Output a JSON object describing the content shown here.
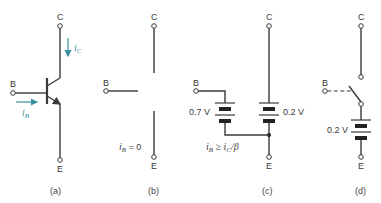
{
  "figure": {
    "panels": [
      {
        "id": "a",
        "caption": "(a)",
        "terminals": {
          "collector": "C",
          "base": "B",
          "emitter": "E"
        },
        "currents": {
          "collector": {
            "symbol": "i",
            "subscript": "C"
          },
          "base": {
            "symbol": "i",
            "subscript": "B"
          }
        }
      },
      {
        "id": "b",
        "caption": "(b)",
        "terminals": {
          "collector": "C",
          "base": "B",
          "emitter": "E"
        },
        "condition": {
          "symbol": "i",
          "subscript": "B",
          "relation": " = 0"
        }
      },
      {
        "id": "c",
        "caption": "(c)",
        "terminals": {
          "collector": "C",
          "base": "B",
          "emitter": "E"
        },
        "sources": [
          {
            "label": "0.7 V"
          },
          {
            "label": "0.2 V"
          }
        ],
        "condition": {
          "text_1": "i",
          "sub_1": "B",
          "rel": " ≥ i",
          "sub_2": "C",
          "tail": "/β"
        }
      },
      {
        "id": "d",
        "caption": "(d)",
        "terminals": {
          "collector": "C",
          "base": "B",
          "emitter": "E"
        },
        "sources": [
          {
            "label": "0.2 V"
          }
        ]
      }
    ],
    "colors": {
      "line": "#3a3a3a",
      "current_arrow": "#3a8fa0"
    }
  }
}
